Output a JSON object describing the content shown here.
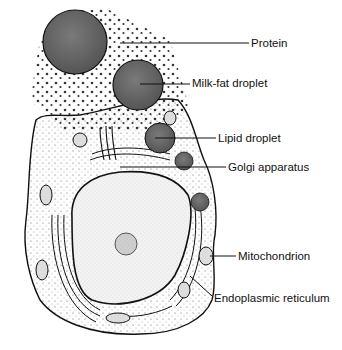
{
  "labels": [
    {
      "id": "protein",
      "text": "Protein",
      "x": 251,
      "y": 37
    },
    {
      "id": "milk-fat-droplet",
      "text": "Milk-fat droplet",
      "x": 192,
      "y": 77
    },
    {
      "id": "lipid-droplet",
      "text": "Lipid droplet",
      "x": 218,
      "y": 132
    },
    {
      "id": "golgi-apparatus",
      "text": "Golgi apparatus",
      "x": 228,
      "y": 161
    },
    {
      "id": "mitochondrion",
      "text": "Mitochondrion",
      "x": 238,
      "y": 250
    },
    {
      "id": "endoplasmic-reticulum",
      "text": "Endoplasmic reticulum",
      "x": 214,
      "y": 292
    }
  ],
  "colors": {
    "ink": "#111111",
    "droplet": "#6d6d6d",
    "nucleus": "#efefef",
    "background": "#ffffff"
  }
}
